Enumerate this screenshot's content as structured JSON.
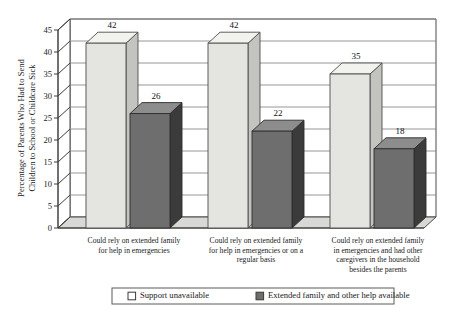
{
  "chart_data": {
    "type": "bar",
    "title": "",
    "xlabel": "",
    "ylabel": "Percentage of Parents Who Had to Send Children to School or Childcare Sick",
    "ylabel_lines": [
      "Percentage of Parents Who Had to Send",
      "Children to School or Childcare Sick"
    ],
    "ylim": [
      0,
      45
    ],
    "ytick_step": 5,
    "yticks": [
      "0",
      "5",
      "10",
      "15",
      "20",
      "25",
      "30",
      "35",
      "40",
      "45"
    ],
    "grid": true,
    "grid_axis": "y",
    "legend_position": "bottom",
    "categories": [
      "Could rely on extended family for help in emergencies",
      "Could rely on extended family for help in emergencies or on a regular basis",
      "Could rely on extended family in emergencies and had other caregivers in the household besides the parents"
    ],
    "category_lines": [
      [
        "Could rely on extended family",
        "for help in emergencies"
      ],
      [
        "Could rely on extended family",
        "for help in emergencies or on a",
        "regular basis"
      ],
      [
        "Could rely on extended family",
        "in emergencies and had other",
        "caregivers in the household",
        "besides the parents"
      ]
    ],
    "series": [
      {
        "name": "Support unavailable",
        "values": [
          42,
          42,
          35
        ],
        "color": "#e4e4e1"
      },
      {
        "name": "Extended family and other help available",
        "values": [
          26,
          22,
          18
        ],
        "color": "#6e6e6e"
      }
    ]
  },
  "legend": {
    "items": [
      {
        "label": "Support unavailable",
        "swatch": "light-swatch-icon"
      },
      {
        "label": "Extended family and other help available",
        "swatch": "dark-swatch-icon"
      }
    ]
  },
  "colors": {
    "series_a": "#e4e4e1",
    "series_a_top": "#f2f2ef",
    "series_a_side": "#c3c3bf",
    "series_b": "#6e6e6e",
    "series_b_top": "#8d8d8d",
    "series_b_side": "#3b3b3b",
    "axis": "#3d3d3d",
    "grid": "#8a8a8a",
    "floor": "#d8d8d4",
    "background": "#ffffff"
  }
}
